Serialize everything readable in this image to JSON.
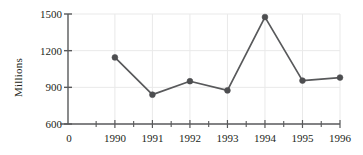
{
  "chart_data": {
    "type": "line",
    "title": "",
    "subtitle": "",
    "xlabel": "",
    "ylabel": "Millions",
    "x": [
      1990,
      1991,
      1992,
      1993,
      1994,
      1995,
      1996
    ],
    "categories": [
      "1990",
      "1991",
      "1992",
      "1993",
      "1994",
      "1995",
      "1996"
    ],
    "values": [
      1145,
      840,
      950,
      875,
      1475,
      955,
      980
    ],
    "series": [
      {
        "name": "Millions",
        "values": [
          1145,
          840,
          950,
          875,
          1475,
          955,
          980
        ]
      }
    ],
    "ylim": [
      600,
      1500
    ],
    "y_ticks": [
      600,
      900,
      1200,
      1500
    ],
    "y_tick_labels": [
      "600",
      "900",
      "1200",
      "1500"
    ],
    "xlim": [
      1988.75,
      1996.0
    ],
    "x_ticks": [
      1990,
      1991,
      1992,
      1993,
      1994,
      1995,
      1996
    ],
    "x_tick_labels": [
      "1990",
      "1991",
      "1992",
      "1993",
      "1994",
      "1995",
      "1996"
    ],
    "x_origin_label": "0",
    "x_minor_ticks": [
      1989.5,
      1990.5,
      1991.5,
      1992.5,
      1993.5,
      1994.5,
      1995.5
    ],
    "grid": true,
    "grid_axis": "both",
    "legend": false,
    "legend_position": "none",
    "marker": "circle",
    "colors": {
      "line": "#58595b",
      "marker": "#4d4e50",
      "grid": "#e9e9e9",
      "axis": "#58595b",
      "text": "#231f20",
      "background": "#ffffff"
    },
    "annotations": []
  }
}
